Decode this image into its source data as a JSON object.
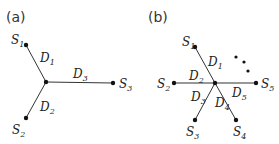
{
  "panels": [
    {
      "label": "(a)",
      "center": [
        46,
        82
      ],
      "nodes": [
        {
          "name": "S",
          "sub": "1",
          "pos": [
            26,
            45
          ],
          "label_pos": [
            11,
            44
          ]
        },
        {
          "name": "S",
          "sub": "2",
          "pos": [
            26,
            118
          ],
          "label_pos": [
            12,
            134
          ]
        },
        {
          "name": "S",
          "sub": "3",
          "pos": [
            113,
            83
          ],
          "label_pos": [
            119,
            88
          ]
        }
      ],
      "edges": [
        {
          "name": "D",
          "sub": "1",
          "label_pos": [
            40,
            62
          ]
        },
        {
          "name": "D",
          "sub": "2",
          "label_pos": [
            40,
            111
          ]
        },
        {
          "name": "D",
          "sub": "3",
          "label_pos": [
            73,
            78
          ]
        }
      ]
    },
    {
      "label": "(b)",
      "center": [
        215,
        83
      ],
      "nodes": [
        {
          "name": "S",
          "sub": "1",
          "pos": [
            195,
            47
          ],
          "label_pos": [
            182,
            46
          ]
        },
        {
          "name": "S",
          "sub": "2",
          "pos": [
            174,
            83
          ],
          "label_pos": [
            157,
            88
          ]
        },
        {
          "name": "S",
          "sub": "3",
          "pos": [
            195,
            120
          ],
          "label_pos": [
            186,
            136
          ]
        },
        {
          "name": "S",
          "sub": "4",
          "pos": [
            236,
            120
          ],
          "label_pos": [
            233,
            136
          ]
        },
        {
          "name": "S",
          "sub": "5",
          "pos": [
            256,
            83
          ],
          "label_pos": [
            261,
            88
          ]
        }
      ],
      "edges": [
        {
          "name": "D",
          "sub": "1",
          "label_pos": [
            208,
            66
          ]
        },
        {
          "name": "D",
          "sub": "2",
          "label_pos": [
            189,
            80
          ]
        },
        {
          "name": "D",
          "sub": "3",
          "label_pos": [
            191,
            101
          ]
        },
        {
          "name": "D",
          "sub": "4",
          "label_pos": [
            215,
            107
          ]
        },
        {
          "name": "D",
          "sub": "5",
          "label_pos": [
            232,
            97
          ]
        }
      ],
      "ellipsis_dots": [
        [
          236,
          57
        ],
        [
          244,
          62
        ],
        [
          248,
          71
        ]
      ]
    }
  ]
}
